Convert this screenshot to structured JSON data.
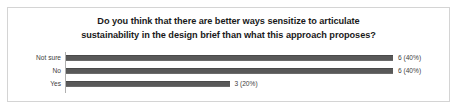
{
  "chart_data": {
    "type": "bar",
    "orientation": "horizontal",
    "title": "Do you think that there are better ways sensitize to articulate sustainability in the design brief than what this approach proposes?",
    "title_line_1": "Do you think that there are better ways sensitize to articulate",
    "title_line_2": "sustainability in the design brief than what this approach proposes?",
    "xlabel": "",
    "ylabel": "",
    "grid": false,
    "legend": false,
    "xlim": [
      0,
      6
    ],
    "categories": [
      "Not sure",
      "No",
      "Yes"
    ],
    "values": [
      6,
      6,
      3
    ],
    "percentages": [
      "40%",
      "40%",
      "20%"
    ],
    "data_labels": [
      "6 (40%)",
      "6 (40%)",
      "3 (20%)"
    ],
    "total_responses": 15,
    "bar_color": "#595959",
    "axis_color": "#b0b0b0",
    "border_color": "#d4d4d4",
    "text_color": "#3d3d3d",
    "title_color": "#1a1a1a"
  }
}
